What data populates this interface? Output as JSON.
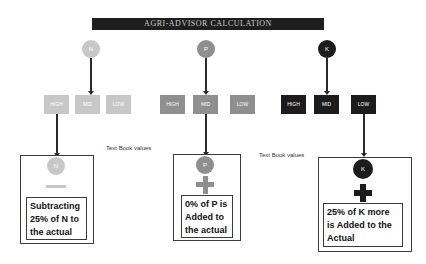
{
  "title": "AGRI-ADVISOR CALCULATION",
  "colors": {
    "n": "#c7c7c7",
    "p": "#8f8f8f",
    "k": "#1c1c1c",
    "title_bg": "#1e1e1e"
  },
  "nutrients": [
    {
      "letter": "N",
      "levels": [
        "HIGH",
        "MID",
        "LOW"
      ],
      "selected_level": "HIGH",
      "operator": "minus",
      "operator_symbol": "—",
      "result_text": "Subtracting 25% of N to the actual"
    },
    {
      "letter": "P",
      "levels": [
        "HIGH",
        "MID",
        "LOW"
      ],
      "selected_level": "MID",
      "operator": "plus",
      "operator_symbol": "+",
      "result_text": "0% of P is Added to the actual"
    },
    {
      "letter": "K",
      "levels": [
        "HIGH",
        "MID",
        "LOW"
      ],
      "selected_level": "LOW",
      "operator": "plus",
      "operator_symbol": "+",
      "result_text": "25% of K more is Added to the Actual"
    }
  ],
  "annotations": [
    "Text Book values",
    "Text Book values"
  ]
}
